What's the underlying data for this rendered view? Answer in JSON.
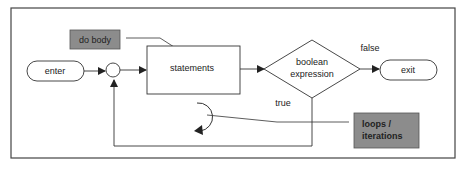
{
  "diagram": {
    "nodes": {
      "enter": "enter",
      "statements": "statements",
      "condition_line1": "boolean",
      "condition_line2": "expression",
      "exit": "exit"
    },
    "edge_labels": {
      "false": "false",
      "true": "true"
    },
    "callouts": {
      "do_body": "do body",
      "loops_line1": "loops /",
      "loops_line2": "iterations"
    },
    "colors": {
      "callout_fill": "#8c8c8c",
      "stroke": "#333333",
      "frame": "#444444"
    }
  }
}
